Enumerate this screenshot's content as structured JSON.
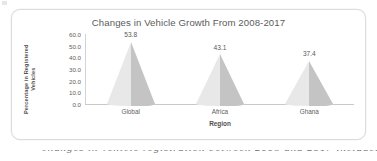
{
  "figure": {
    "title": "Changes in Vehicle Growth From 2008-2017"
  },
  "axes": {
    "y_title_line1": "Percentage in Registered",
    "y_title_line2": "Vehicles",
    "x_title": "Region"
  },
  "caption": {
    "clipped_text": "changes in vehicle registration between 2008 and 2017 included"
  },
  "chart_data": {
    "type": "bar",
    "title": "Changes in Vehicle Growth From 2008-2017",
    "xlabel": "Region",
    "ylabel": "Percentage in Registered Vehicles",
    "categories": [
      "Global",
      "Africa",
      "Ghana"
    ],
    "values": [
      53.8,
      43.1,
      37.4
    ],
    "value_labels": [
      "53.8",
      "43.1",
      "37.4"
    ],
    "ylim": [
      0,
      60
    ],
    "ytick_labels": [
      "60.0",
      "50.0",
      "40.0",
      "30.0",
      "20.0",
      "10.0",
      "0.0"
    ],
    "ytick_values": [
      60,
      50,
      40,
      30,
      20,
      10,
      0
    ],
    "grid": false,
    "legend": false,
    "bar_style": "cone",
    "colors": {
      "bar_light": "#e8e8e8",
      "bar_shade": "#c4c4c4",
      "axis": "#c9c9c9",
      "text": "#5b5b5b",
      "frame": "#dcdcdc"
    }
  }
}
